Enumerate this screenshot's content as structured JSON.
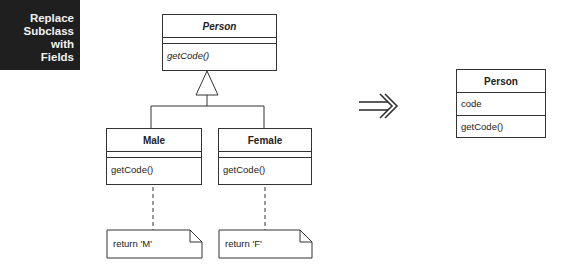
{
  "title": {
    "lines": [
      "Replace",
      "Subclass with",
      "Fields"
    ]
  },
  "before": {
    "superclass": {
      "name": "Person",
      "operations": [
        "getCode()"
      ]
    },
    "subclasses": [
      {
        "name": "Male",
        "operations": [
          "getCode()"
        ],
        "note": "return 'M'"
      },
      {
        "name": "Female",
        "operations": [
          "getCode()"
        ],
        "note": "return 'F'"
      }
    ]
  },
  "transform_arrow": "⇛",
  "after": {
    "class": {
      "name": "Person",
      "attributes": [
        "code"
      ],
      "operations": [
        "getCode()"
      ]
    }
  }
}
